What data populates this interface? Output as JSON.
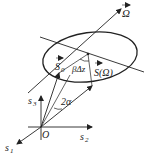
{
  "diagram": {
    "labels": {
      "omega": "Ω",
      "s0": "S",
      "s0_sub": "0",
      "s_omega": "S(Ω)",
      "beta_dz": "βΔz",
      "two_alpha": "2α",
      "origin": "O",
      "s1": "s",
      "s1_sub": "1",
      "s2": "s",
      "s2_sub": "2",
      "s3": "s",
      "s3_sub": "3"
    },
    "colors": {
      "stroke": "#222222",
      "background": "#ffffff"
    }
  }
}
